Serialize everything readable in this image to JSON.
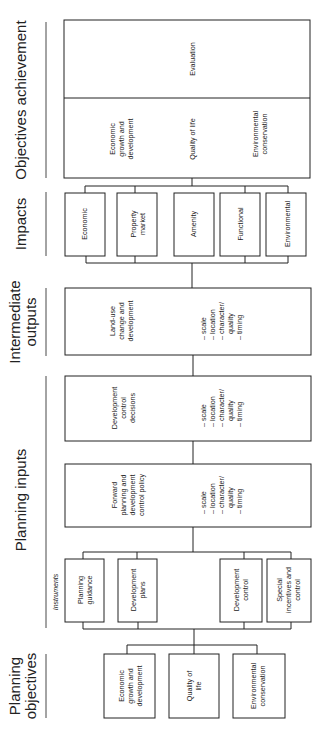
{
  "stages": {
    "objectives_achievement": "Objectives achievement",
    "impacts": "Impacts",
    "intermediate_outputs_1": "Intermediate",
    "intermediate_outputs_2": "outputs",
    "planning_inputs": "Planning inputs",
    "planning_objectives_1": "Planning",
    "planning_objectives_2": "objectives"
  },
  "achievement": {
    "evaluation": "Evaluation",
    "outcomes": [
      {
        "lines": [
          "Economic",
          "growth and",
          "development"
        ]
      },
      {
        "lines": [
          "Quality of life"
        ]
      },
      {
        "lines": [
          "Environmental",
          "conservation"
        ]
      }
    ]
  },
  "impacts": [
    {
      "lines": [
        "Economic"
      ]
    },
    {
      "lines": [
        "Property",
        "market"
      ]
    },
    {
      "lines": [
        "Amenity"
      ]
    },
    {
      "lines": [
        "Functional"
      ]
    },
    {
      "lines": [
        "Environmental"
      ]
    }
  ],
  "attributes": [
    "– scale",
    "– location",
    "– character/",
    "quality",
    "– timing"
  ],
  "intermediate_outputs": {
    "title_lines": [
      "Land-use",
      "change and",
      "development"
    ]
  },
  "development_control_decisions": {
    "title_lines": [
      "Development",
      "control",
      "decisions"
    ]
  },
  "forward_planning": {
    "title_lines": [
      "Forward",
      "planning and",
      "development",
      "control policy"
    ]
  },
  "instruments": {
    "label": "Instruments",
    "items": [
      {
        "lines": [
          "Planning",
          "guidance"
        ]
      },
      {
        "lines": [
          "Development",
          "plans"
        ]
      },
      {
        "lines": [
          "Development",
          "control"
        ]
      },
      {
        "lines": [
          "Special",
          "incentives and",
          "control"
        ]
      }
    ]
  },
  "planning_objectives": [
    {
      "lines": [
        "Economic",
        "growth and",
        "development"
      ]
    },
    {
      "lines": [
        "Quality of",
        "life"
      ]
    },
    {
      "lines": [
        "Environmental",
        "conservation"
      ]
    }
  ]
}
